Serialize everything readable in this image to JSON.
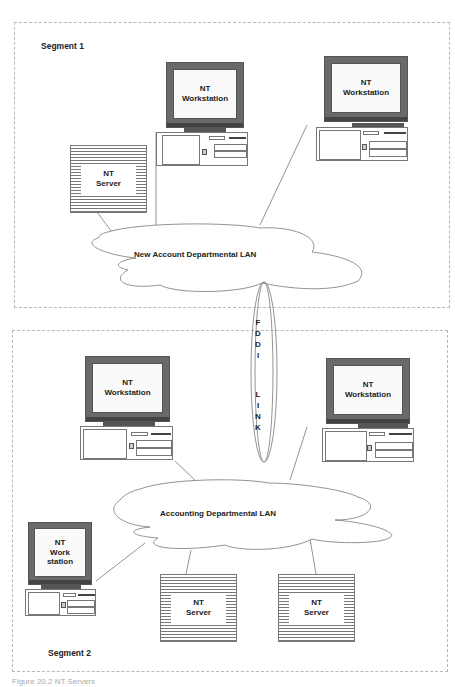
{
  "diagram": {
    "segments": [
      {
        "label": "Segment 1"
      },
      {
        "label": "Segment 2"
      }
    ],
    "lans": [
      {
        "label": "New Account Departmental LAN"
      },
      {
        "label": "Accounting Departmental LAN"
      }
    ],
    "link": {
      "label_top": [
        "F",
        "D",
        "D",
        "I"
      ],
      "label_bottom": [
        "L",
        "I",
        "N",
        "K"
      ],
      "full_label": "FDDI LINK"
    },
    "nodes": {
      "seg1_server": {
        "line1": "NT",
        "line2": "Server"
      },
      "seg1_ws_left": {
        "line1": "NT",
        "line2": "Workstation"
      },
      "seg1_ws_right": {
        "line1": "NT",
        "line2": "Workstation"
      },
      "seg2_ws_left": {
        "line1": "NT",
        "line2": "Workstation"
      },
      "seg2_ws_right": {
        "line1": "NT",
        "line2": "Workstation"
      },
      "seg2_ws_small": {
        "line1": "NT",
        "line2": "Work",
        "line3": "station"
      },
      "seg2_server_a": {
        "line1": "NT",
        "line2": "Server"
      },
      "seg2_server_b": {
        "line1": "NT",
        "line2": "Server"
      }
    },
    "caption": "Figure 20.2    NT Servers"
  }
}
